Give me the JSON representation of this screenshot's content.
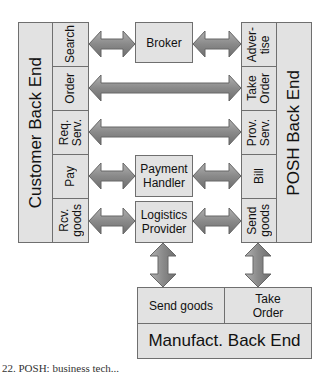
{
  "customer": {
    "title": "Customer Back End",
    "items": [
      "Search",
      "Order",
      "Req.\nServ.",
      "Pay",
      "Rcv.\ngoods"
    ]
  },
  "posh": {
    "title": "POSH Back End",
    "items": [
      "Adver-\ntise",
      "Take\nOrder",
      "Prov.\nServ.",
      "Bill",
      "Send\ngoods"
    ]
  },
  "middle": {
    "broker": "Broker",
    "payment": "Payment\nHandler",
    "logistics": "Logistics\nProvider"
  },
  "manufact": {
    "title": "Manufact. Back End",
    "send_goods": "Send goods",
    "take_order": "Take\nOrder"
  },
  "caption": "22. POSH: business tech..."
}
